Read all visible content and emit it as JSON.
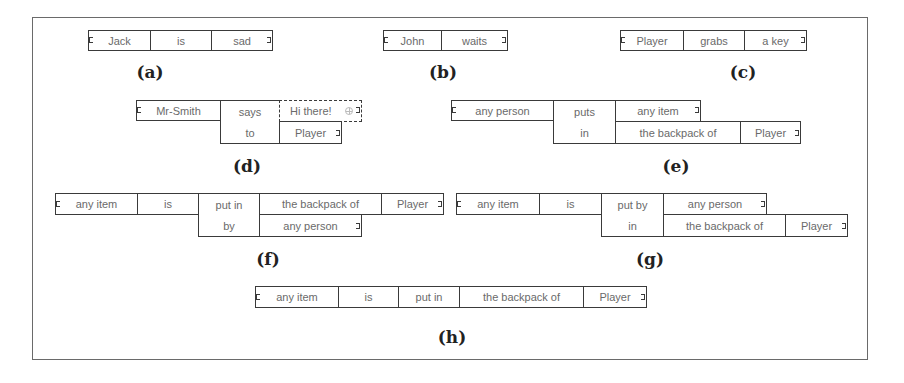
{
  "panels": {
    "a": {
      "label": "(a)",
      "cells": [
        "Jack",
        "is",
        "sad"
      ]
    },
    "b": {
      "label": "(b)",
      "cells": [
        "John",
        "waits"
      ]
    },
    "c": {
      "label": "(c)",
      "cells": [
        "Player",
        "grabs",
        "a key"
      ]
    },
    "d": {
      "label": "(d)",
      "subject": "Mr-Smith",
      "verb_top": "says",
      "verb_bottom": "to",
      "object_top": "Hi there!",
      "object_bottom": "Player"
    },
    "e": {
      "label": "(e)",
      "subject": "any person",
      "verb_top": "puts",
      "verb_bottom": "in",
      "object_top": "any item",
      "object_bottom": "the backpack of",
      "object_bottom_owner": "Player"
    },
    "f": {
      "label": "(f)",
      "subject": "any item",
      "verb": "is",
      "prep_top": "put in",
      "prep_bottom": "by",
      "object_top": "the backpack of",
      "object_top_owner": "Player",
      "object_bottom": "any person"
    },
    "g": {
      "label": "(g)",
      "subject": "any item",
      "verb": "is",
      "prep_top": "put by",
      "prep_bottom": "in",
      "object_top": "any person",
      "object_bottom": "the backpack of",
      "object_bottom_owner": "Player"
    },
    "h": {
      "label": "(h)",
      "cells": [
        "any item",
        "is",
        "put in",
        "the backpack of",
        "Player"
      ]
    }
  }
}
